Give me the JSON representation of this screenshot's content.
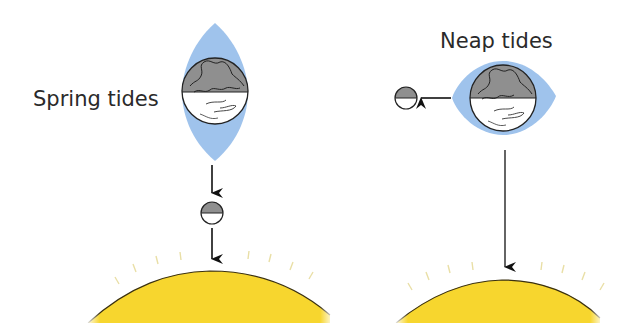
{
  "colors": {
    "tidal_bulge": "#9fc3ec",
    "sun": "#f7d62e",
    "sun_edge": "#3a3010",
    "sun_rays": "#e9dfa6",
    "earth_dark": "#8f8f8f",
    "moon_dark": "#8f8f8f",
    "arrow": "#111111",
    "text": "#2a2a2a"
  },
  "panels": [
    {
      "id": "spring",
      "label": "Spring tides",
      "description": "Sun, Moon and Earth aligned; tidal bulge elongated along the line",
      "elements": [
        "tidal-bulge",
        "earth",
        "arrow-earth-to-moon",
        "moon",
        "arrow-moon-to-sun",
        "sun"
      ]
    },
    {
      "id": "neap",
      "label": "Neap tides",
      "description": "Moon at right angle to Sun; tidal bulge rounded",
      "elements": [
        "moon",
        "arrow-earth-to-moon",
        "tidal-bulge",
        "earth",
        "arrow-earth-to-sun",
        "sun"
      ]
    }
  ]
}
